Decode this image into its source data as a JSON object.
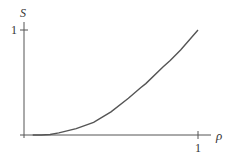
{
  "chart_data": {
    "type": "line",
    "title": "",
    "xlabel": "ρ",
    "ylabel": "S",
    "xlim": [
      0,
      1
    ],
    "ylim": [
      0,
      1
    ],
    "x_ticks": [
      "1"
    ],
    "y_ticks": [
      "1"
    ],
    "grid": false,
    "legend": null,
    "series": [
      {
        "name": "S(ρ)",
        "x": [
          0.05,
          0.1,
          0.15,
          0.2,
          0.3,
          0.4,
          0.44,
          0.5,
          0.6,
          0.67,
          0.7,
          0.8,
          0.84,
          0.9,
          1.0
        ],
        "values": [
          0.0,
          0.0,
          0.005,
          0.02,
          0.06,
          0.12,
          0.16,
          0.22,
          0.35,
          0.45,
          0.49,
          0.65,
          0.71,
          0.81,
          1.0
        ]
      }
    ]
  },
  "labels": {
    "y_axis": "S",
    "x_axis": "ρ",
    "y_tick": "1",
    "x_tick": "1"
  },
  "colors": {
    "axis": "#555555",
    "curve": "#555555",
    "text": "#333333"
  }
}
